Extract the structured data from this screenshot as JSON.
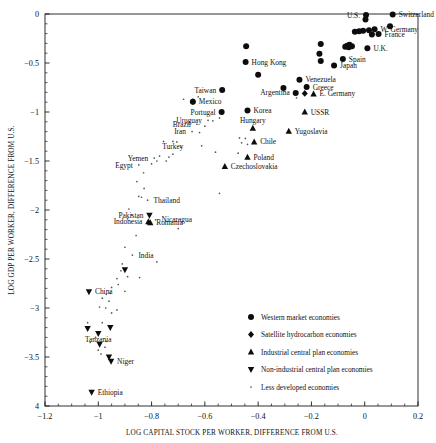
{
  "chart_data": {
    "type": "scatter",
    "title": "",
    "xlabel": "LOG CAPITAL STOCK PER WORKER, DIFFERENCE FROM U.S.",
    "ylabel": "LOG GDP PER WORKER, DIFFERENCE FROM U.S.",
    "xlim": [
      -1.2,
      0.2
    ],
    "ylim": [
      -4,
      0
    ],
    "grid": false,
    "legend_position": "lower-right-inside",
    "xticks": [
      "-1.2",
      "-1",
      "-0.8",
      "-0.6",
      "-0.4",
      "-0.2",
      "0",
      "0.2"
    ],
    "xtick_values": [
      -1.2,
      -1.0,
      -0.8,
      -0.6,
      -0.4,
      -0.2,
      0,
      0.2
    ],
    "yticks": [
      "0",
      "-0.5",
      "-1",
      "-1.5",
      "-2",
      "-2.5",
      "-3",
      "-3.5",
      "4"
    ],
    "ytick_values": [
      0,
      -0.5,
      -1,
      -1.5,
      -2,
      -2.5,
      -3,
      -3.5,
      -4
    ],
    "series": [
      {
        "name": "Western market economies",
        "marker": "circle",
        "points": [
          {
            "x": 0.005,
            "y": -0.01,
            "label": "U.S.",
            "label_pos": "left"
          },
          {
            "x": 0.105,
            "y": -0.005,
            "label": "Switzerland",
            "label_pos": "right"
          },
          {
            "x": 0.003,
            "y": -0.055,
            "label": "",
            "label_pos": "right"
          },
          {
            "x": 0.095,
            "y": -0.125,
            "label": "",
            "label_pos": "right"
          },
          {
            "x": 0.037,
            "y": -0.155,
            "label": "W. Germany",
            "label_pos": "right"
          },
          {
            "x": 0.016,
            "y": -0.165,
            "label": "",
            "label_pos": "right"
          },
          {
            "x": -0.006,
            "y": -0.17,
            "label": "",
            "label_pos": "right"
          },
          {
            "x": -0.021,
            "y": -0.175,
            "label": "",
            "label_pos": "right"
          },
          {
            "x": -0.037,
            "y": -0.18,
            "label": "",
            "label_pos": "right"
          },
          {
            "x": 0.052,
            "y": -0.205,
            "label": "France",
            "label_pos": "right"
          },
          {
            "x": 0.027,
            "y": -0.21,
            "label": "",
            "label_pos": "right"
          },
          {
            "x": -0.165,
            "y": -0.305,
            "label": "",
            "label_pos": "right"
          },
          {
            "x": -0.445,
            "y": -0.33,
            "label": "",
            "label_pos": "right"
          },
          {
            "x": -0.057,
            "y": -0.315,
            "label": "",
            "label_pos": "right"
          },
          {
            "x": -0.066,
            "y": -0.325,
            "label": "",
            "label_pos": "right"
          },
          {
            "x": -0.048,
            "y": -0.33,
            "label": "",
            "label_pos": "right"
          },
          {
            "x": -0.06,
            "y": -0.34,
            "label": "",
            "label_pos": "right"
          },
          {
            "x": -0.073,
            "y": -0.335,
            "label": "",
            "label_pos": "right"
          },
          {
            "x": 0.01,
            "y": -0.35,
            "label": "U.K.",
            "label_pos": "right"
          },
          {
            "x": -0.17,
            "y": -0.405,
            "label": "",
            "label_pos": "right"
          },
          {
            "x": -0.082,
            "y": -0.46,
            "label": "Spain",
            "label_pos": "right"
          },
          {
            "x": -0.165,
            "y": -0.48,
            "label": "",
            "label_pos": "right"
          },
          {
            "x": -0.447,
            "y": -0.49,
            "label": "Hong Kong",
            "label_pos": "right"
          },
          {
            "x": -0.115,
            "y": -0.525,
            "label": "Japan",
            "label_pos": "right"
          },
          {
            "x": -0.4,
            "y": -0.62,
            "label": "",
            "label_pos": "right"
          },
          {
            "x": -0.245,
            "y": -0.67,
            "label": "Venezuela",
            "label_pos": "right"
          },
          {
            "x": -0.305,
            "y": -0.755,
            "label": "",
            "label_pos": "right"
          },
          {
            "x": -0.218,
            "y": -0.745,
            "label": "Greece",
            "label_pos": "right"
          },
          {
            "x": -0.535,
            "y": -0.775,
            "label": "Taiwan",
            "label_pos": "left"
          },
          {
            "x": -0.259,
            "y": -0.805,
            "label": "Argentina",
            "label_pos": "left"
          },
          {
            "x": -0.645,
            "y": -0.895,
            "label": "Mexico",
            "label_pos": "right"
          },
          {
            "x": -0.537,
            "y": -1.0,
            "label": "Portugal",
            "label_pos": "left"
          },
          {
            "x": -0.44,
            "y": -0.985,
            "label": "Korea",
            "label_pos": "right"
          }
        ]
      },
      {
        "name": "Satellite hydrocarbon economies",
        "marker": "diamond",
        "points": [
          {
            "x": -0.225,
            "y": -0.81,
            "label": "",
            "label_pos": "right"
          },
          {
            "x": -0.645,
            "y": -0.895,
            "label": "",
            "label_pos": "left"
          }
        ]
      },
      {
        "name": "Industrial central plan economies",
        "marker": "triangle-up",
        "points": [
          {
            "x": -0.192,
            "y": -0.815,
            "label": "E. Germany",
            "label_pos": "right"
          },
          {
            "x": -0.225,
            "y": -1.0,
            "label": "USSR",
            "label_pos": "right"
          },
          {
            "x": -0.42,
            "y": -1.165,
            "label": "Hungary",
            "label_pos": "above"
          },
          {
            "x": -0.285,
            "y": -1.195,
            "label": "Yugoslavia",
            "label_pos": "right"
          },
          {
            "x": -0.415,
            "y": -1.305,
            "label": "Chile",
            "label_pos": "right"
          },
          {
            "x": -0.44,
            "y": -1.46,
            "label": "Poland",
            "label_pos": "right"
          },
          {
            "x": -0.525,
            "y": -1.555,
            "label": "Czechoslovakia",
            "label_pos": "right"
          },
          {
            "x": -0.805,
            "y": -2.13,
            "label": "Romania",
            "label_pos": "right"
          },
          {
            "x": -0.812,
            "y": -2.12,
            "label": "Indonesia",
            "label_pos": "left"
          }
        ]
      },
      {
        "name": "Non-industrial central plan economies",
        "marker": "triangle-down",
        "points": [
          {
            "x": -0.808,
            "y": -2.055,
            "label": "Pakistan",
            "label_pos": "left"
          },
          {
            "x": -0.9,
            "y": -2.61,
            "label": "",
            "label_pos": "right"
          },
          {
            "x": -1.035,
            "y": -2.835,
            "label": "China",
            "label_pos": "right"
          },
          {
            "x": -1.04,
            "y": -3.21,
            "label": "",
            "label_pos": "right"
          },
          {
            "x": -0.955,
            "y": -3.2,
            "label": "",
            "label_pos": "right"
          },
          {
            "x": -1.0,
            "y": -3.26,
            "label": "Tanzania",
            "label_pos": "below"
          },
          {
            "x": -0.995,
            "y": -3.37,
            "label": "",
            "label_pos": "right"
          },
          {
            "x": -0.96,
            "y": -3.5,
            "label": "",
            "label_pos": "right"
          },
          {
            "x": -0.952,
            "y": -3.545,
            "label": "Niger",
            "label_pos": "right"
          },
          {
            "x": -1.025,
            "y": -3.86,
            "label": "Ethiopia",
            "label_pos": "right"
          }
        ]
      },
      {
        "name": "Less developed economies",
        "marker": "dot",
        "points": [
          {
            "x": -0.625,
            "y": -0.845,
            "label": ""
          },
          {
            "x": -0.68,
            "y": -0.87,
            "label": ""
          },
          {
            "x": -0.256,
            "y": -0.855,
            "label": ""
          },
          {
            "x": -0.545,
            "y": -1.06,
            "label": ""
          },
          {
            "x": -0.57,
            "y": -1.09,
            "label": ""
          },
          {
            "x": -0.588,
            "y": -1.085,
            "label": "Uruguay",
            "label_pos": "left"
          },
          {
            "x": -0.63,
            "y": -1.125,
            "label": "Brazil",
            "label_pos": "left"
          },
          {
            "x": -0.6,
            "y": -1.145,
            "label": ""
          },
          {
            "x": -0.648,
            "y": -1.2,
            "label": "Iran",
            "label_pos": "left"
          },
          {
            "x": -0.62,
            "y": -1.21,
            "label": ""
          },
          {
            "x": -0.47,
            "y": -1.265,
            "label": ""
          },
          {
            "x": -0.448,
            "y": -1.27,
            "label": ""
          },
          {
            "x": -0.755,
            "y": -1.3,
            "label": ""
          },
          {
            "x": -0.72,
            "y": -1.3,
            "label": ""
          },
          {
            "x": -0.705,
            "y": -1.305,
            "label": ""
          },
          {
            "x": -0.462,
            "y": -1.315,
            "label": ""
          },
          {
            "x": -0.44,
            "y": -1.33,
            "label": ""
          },
          {
            "x": -0.612,
            "y": -1.345,
            "label": ""
          },
          {
            "x": -0.69,
            "y": -1.36,
            "label": ""
          },
          {
            "x": -0.56,
            "y": -1.41,
            "label": ""
          },
          {
            "x": -0.475,
            "y": -1.42,
            "label": ""
          },
          {
            "x": -0.72,
            "y": -1.43,
            "label": "Turkey",
            "label_pos": "above"
          },
          {
            "x": -0.77,
            "y": -1.45,
            "label": ""
          },
          {
            "x": -0.735,
            "y": -1.46,
            "label": ""
          },
          {
            "x": -0.79,
            "y": -1.47,
            "label": "Yemen",
            "label_pos": "left"
          },
          {
            "x": -0.745,
            "y": -1.5,
            "label": ""
          },
          {
            "x": -0.78,
            "y": -1.5,
            "label": ""
          },
          {
            "x": -0.8,
            "y": -1.53,
            "label": ""
          },
          {
            "x": -0.848,
            "y": -1.54,
            "label": "Egypt",
            "label_pos": "left"
          },
          {
            "x": -0.83,
            "y": -1.62,
            "label": ""
          },
          {
            "x": -0.855,
            "y": -1.71,
            "label": ""
          },
          {
            "x": -0.828,
            "y": -1.78,
            "label": ""
          },
          {
            "x": -0.545,
            "y": -1.83,
            "label": ""
          },
          {
            "x": -0.848,
            "y": -1.86,
            "label": ""
          },
          {
            "x": -0.838,
            "y": -1.87,
            "label": ""
          },
          {
            "x": -0.815,
            "y": -1.9,
            "label": "Thailand",
            "label_pos": "right"
          },
          {
            "x": -0.885,
            "y": -1.99,
            "label": ""
          },
          {
            "x": -0.875,
            "y": -2.05,
            "label": ""
          },
          {
            "x": -0.89,
            "y": -2.09,
            "label": ""
          },
          {
            "x": -0.785,
            "y": -2.1,
            "label": "Nicaragua",
            "label_pos": "right"
          },
          {
            "x": -0.7,
            "y": -2.19,
            "label": ""
          },
          {
            "x": -0.858,
            "y": -2.26,
            "label": ""
          },
          {
            "x": -0.9,
            "y": -2.38,
            "label": ""
          },
          {
            "x": -0.872,
            "y": -2.46,
            "label": "India",
            "label_pos": "right"
          },
          {
            "x": -0.78,
            "y": -2.53,
            "label": ""
          },
          {
            "x": -0.91,
            "y": -2.55,
            "label": ""
          },
          {
            "x": -0.915,
            "y": -2.62,
            "label": ""
          },
          {
            "x": -0.89,
            "y": -2.68,
            "label": ""
          },
          {
            "x": -0.845,
            "y": -2.69,
            "label": ""
          },
          {
            "x": -0.93,
            "y": -2.7,
            "label": ""
          },
          {
            "x": -0.925,
            "y": -2.76,
            "label": ""
          },
          {
            "x": -0.95,
            "y": -2.79,
            "label": ""
          },
          {
            "x": -0.9,
            "y": -2.83,
            "label": ""
          },
          {
            "x": -0.955,
            "y": -2.85,
            "label": ""
          },
          {
            "x": -0.97,
            "y": -2.86,
            "label": ""
          },
          {
            "x": -0.985,
            "y": -2.9,
            "label": ""
          },
          {
            "x": -0.96,
            "y": -2.93,
            "label": ""
          },
          {
            "x": -0.995,
            "y": -2.99,
            "label": ""
          },
          {
            "x": -0.972,
            "y": -3.0,
            "label": ""
          },
          {
            "x": -0.93,
            "y": -3.02,
            "label": ""
          },
          {
            "x": -0.95,
            "y": -3.05,
            "label": ""
          },
          {
            "x": -1.04,
            "y": -3.15,
            "label": ""
          },
          {
            "x": -0.985,
            "y": -3.15,
            "label": ""
          },
          {
            "x": -1.01,
            "y": -3.3,
            "label": ""
          },
          {
            "x": -1.03,
            "y": -3.35,
            "label": ""
          },
          {
            "x": -0.97,
            "y": -3.34,
            "label": ""
          },
          {
            "x": -0.975,
            "y": -3.4,
            "label": ""
          },
          {
            "x": -1.0,
            "y": -3.43,
            "label": ""
          },
          {
            "x": -0.99,
            "y": -3.47,
            "label": ""
          }
        ]
      }
    ]
  },
  "legend": {
    "entries": [
      {
        "marker": "circle",
        "label": "Western market economies"
      },
      {
        "marker": "diamond",
        "label": "Satellite hydrocarbon economies"
      },
      {
        "marker": "triangle-up",
        "label": "Industrial central plan economies"
      },
      {
        "marker": "triangle-down",
        "label": "Non-industrial central plan economies"
      },
      {
        "marker": "dot",
        "label": "Less developed economies"
      }
    ]
  },
  "colors": {
    "axis": "#1a1a1a",
    "marker": "#0d0d0d",
    "background": "#ffffff",
    "text": "#111111"
  }
}
